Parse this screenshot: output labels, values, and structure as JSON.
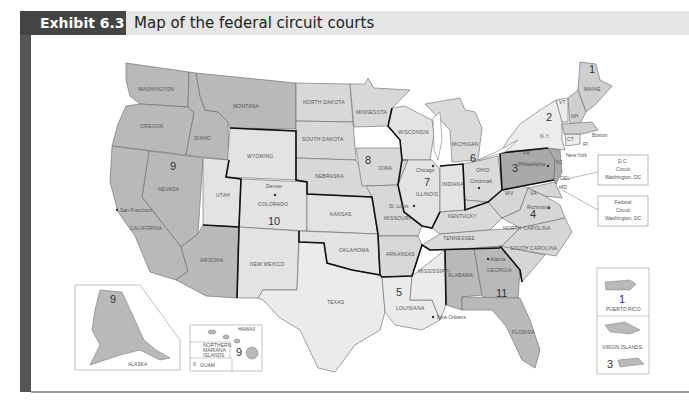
{
  "header": {
    "exhibit_label": "Exhibit 6.3",
    "title": "Map of the federal circuit courts"
  },
  "colors": {
    "header_dark": "#444444",
    "header_light": "#e6e6e6",
    "fill_dark": "#b9b9b9",
    "fill_medium": "#cfcfcf",
    "fill_light": "#e3e3e3",
    "border_circuit": "#111111",
    "border_state": "#666666"
  },
  "circuits": [
    {
      "number": "1",
      "states": [
        "MAINE",
        "NH",
        "MA",
        "RI",
        "PUERTO RICO"
      ]
    },
    {
      "number": "2",
      "states": [
        "N.Y.",
        "VT",
        "CT"
      ]
    },
    {
      "number": "3",
      "states": [
        "PA",
        "NJ",
        "DEL",
        "VIRGIN ISLANDS"
      ]
    },
    {
      "number": "4",
      "states": [
        "WV",
        "VA",
        "MD",
        "NORTH CAROLINA",
        "SOUTH CAROLINA"
      ]
    },
    {
      "number": "5",
      "states": [
        "TEXAS",
        "LOUISIANA",
        "MISSISSIPPI"
      ]
    },
    {
      "number": "6",
      "states": [
        "MICHIGAN",
        "OHIO",
        "KENTUCKY",
        "TENNESSEE"
      ]
    },
    {
      "number": "7",
      "states": [
        "WISCONSIN",
        "ILLINOIS",
        "INDIANA"
      ]
    },
    {
      "number": "8",
      "states": [
        "NORTH DAKOTA",
        "SOUTH DAKOTA",
        "NEBRASKA",
        "MINNESOTA",
        "IOWA",
        "MISSOURI",
        "ARKANSAS"
      ]
    },
    {
      "number": "9",
      "states": [
        "WASHINGTON",
        "OREGON",
        "CALIFORNIA",
        "NEVADA",
        "IDAHO",
        "MONTANA",
        "ARIZONA",
        "ALASKA",
        "HAWAII",
        "NORTHERN MARIANA ISLANDS",
        "GUAM"
      ]
    },
    {
      "number": "10",
      "states": [
        "WYOMING",
        "UTAH",
        "COLORADO",
        "KANSAS",
        "OKLAHOMA",
        "NEW MEXICO"
      ]
    },
    {
      "number": "11",
      "states": [
        "ALABAMA",
        "GEORGIA",
        "FLORIDA"
      ]
    }
  ],
  "state_labels": {
    "washington": "WASHINGTON",
    "oregon": "OREGON",
    "idaho": "IDAHO",
    "montana": "MONTANA",
    "wyoming": "WYOMING",
    "nevada": "NEVADA",
    "california": "CALIFORNIA",
    "utah": "UTAH",
    "colorado": "COLORADO",
    "arizona": "ARIZONA",
    "new_mexico": "NEW MEXICO",
    "north_dakota": "NORTH DAKOTA",
    "south_dakota": "SOUTH DAKOTA",
    "nebraska": "NEBRASKA",
    "kansas": "KANSAS",
    "oklahoma": "OKLAHOMA",
    "texas": "TEXAS",
    "minnesota": "MINNESOTA",
    "iowa": "IOWA",
    "missouri": "MISSOURI",
    "arkansas": "ARKANSAS",
    "louisiana": "LOUISIANA",
    "wisconsin": "WISCONSIN",
    "illinois": "ILLINOIS",
    "michigan": "MICHIGAN",
    "indiana": "INDIANA",
    "ohio": "OHIO",
    "kentucky": "KENTUCKY",
    "tennessee": "TENNESSEE",
    "mississippi": "MISSISSIPPI",
    "alabama": "ALABAMA",
    "georgia": "GEORGIA",
    "florida": "FLORIDA",
    "south_carolina": "SOUTH CAROLINA",
    "north_carolina": "NORTH CAROLINA",
    "virginia": "VA",
    "west_virginia": "WV",
    "pennsylvania": "PA",
    "new_york": "N.Y.",
    "vermont": "VT",
    "new_hampshire": "NH",
    "maine": "MAINE",
    "connecticut": "CT",
    "rhode_island": "RI",
    "new_jersey": "NJ",
    "delaware": "DEL",
    "maryland": "MD",
    "alaska": "ALASKA",
    "hawaii": "HAWAII",
    "northern_mariana": "NORTHERN MARIANA ISLANDS",
    "guam": "GUAM",
    "puerto_rico": "PUERTO RICO",
    "virgin_islands": "VIRGIN ISLANDS"
  },
  "cities": {
    "san_francisco": "San Francisco",
    "denver": "Denver",
    "st_louis": "St. Louis",
    "chicago": "Chicago",
    "cincinnati": "Cincinnati",
    "philadelphia": "Philadelphia",
    "richmond": "Richmond",
    "atlanta": "Atlanta",
    "new_orleans": "New Orleans",
    "new_york": "New York",
    "boston": "Boston"
  },
  "callouts": {
    "dc_circuit": [
      "D.C.",
      "Circuit",
      "Washington, DC"
    ],
    "federal_circuit": [
      "Federal",
      "Circuit",
      "Washington, DC"
    ]
  }
}
